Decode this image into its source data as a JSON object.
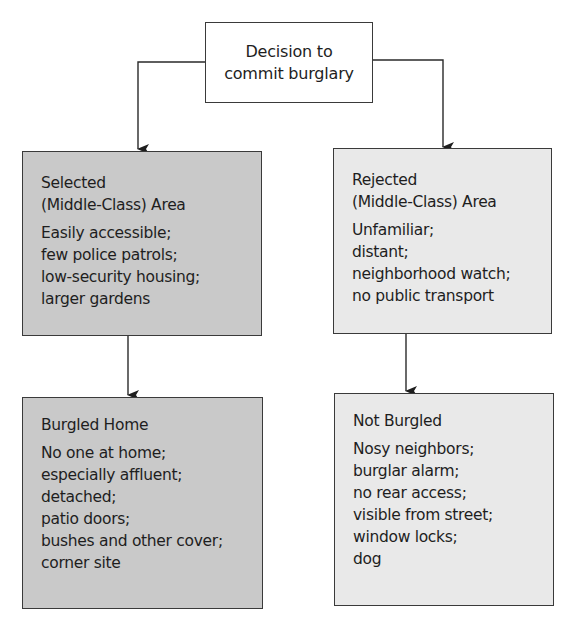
{
  "diagram": {
    "root": {
      "lines": [
        "Decision to",
        "commit burglary"
      ]
    },
    "selected_area": {
      "title_lines": [
        "Selected",
        "(Middle-Class) Area"
      ],
      "items": [
        "Easily accessible;",
        "few police patrols;",
        "low-security housing;",
        "larger gardens"
      ],
      "fill": "#c9c9c9"
    },
    "rejected_area": {
      "title_lines": [
        "Rejected",
        "(Middle-Class) Area"
      ],
      "items": [
        "Unfamiliar;",
        "distant;",
        "neighborhood watch;",
        "no public transport"
      ],
      "fill": "#e9e9e9"
    },
    "burgled_home": {
      "title": "Burgled Home",
      "items": [
        "No one at home;",
        "especially affluent;",
        "detached;",
        "patio doors;",
        "bushes and other cover;",
        "corner site"
      ],
      "fill": "#c9c9c9"
    },
    "not_burgled": {
      "title": "Not Burgled",
      "items": [
        "Nosy neighbors;",
        "burglar alarm;",
        "no rear access;",
        "visible from street;",
        "window locks;",
        "dog"
      ],
      "fill": "#e9e9e9"
    },
    "edges": [
      {
        "from": "Decision to commit burglary",
        "to": "Selected (Middle-Class) Area"
      },
      {
        "from": "Decision to commit burglary",
        "to": "Rejected (Middle-Class) Area"
      },
      {
        "from": "Selected (Middle-Class) Area",
        "to": "Burgled Home"
      },
      {
        "from": "Rejected (Middle-Class) Area",
        "to": "Not Burgled"
      }
    ]
  }
}
